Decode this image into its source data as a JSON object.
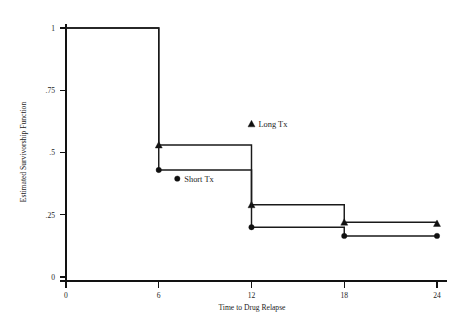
{
  "chart_data": {
    "type": "line",
    "title": "",
    "subtitle": "",
    "xlabel": "Time to Drug Relapse",
    "ylabel": "Estimated Survivorship Function",
    "xlim": [
      0,
      24
    ],
    "ylim": [
      0,
      1
    ],
    "xticks": [
      0,
      6,
      12,
      18,
      24
    ],
    "xticklabels": [
      "0",
      "6",
      "12",
      "18",
      "24"
    ],
    "yticks": [
      0,
      0.25,
      0.5,
      0.75,
      1
    ],
    "yticklabels": [
      "0",
      ".25",
      ".5",
      ".75",
      "1"
    ],
    "grid": false,
    "legend_position": "inside-plot",
    "step_style": "post",
    "series": [
      {
        "name": "Long Tx",
        "marker": "triangle",
        "x": [
          0,
          6,
          12,
          18,
          24
        ],
        "values": [
          1,
          0.53,
          0.29,
          0.22,
          0.215
        ]
      },
      {
        "name": "Short Tx",
        "marker": "circle",
        "x": [
          0,
          6,
          12,
          18,
          24
        ],
        "values": [
          1,
          0.43,
          0.2,
          0.165,
          0.165
        ]
      }
    ],
    "annotations": [
      {
        "text": "Long Tx",
        "marker": "triangle",
        "x": 12.0,
        "y": 0.615
      },
      {
        "text": "Short Tx",
        "marker": "circle",
        "x": 7.2,
        "y": 0.395
      }
    ]
  },
  "style": {
    "axis_color": "#121212",
    "curve_color": "#1a1a1a",
    "text_color": "#1d1d1d",
    "background": "#ffffff"
  }
}
